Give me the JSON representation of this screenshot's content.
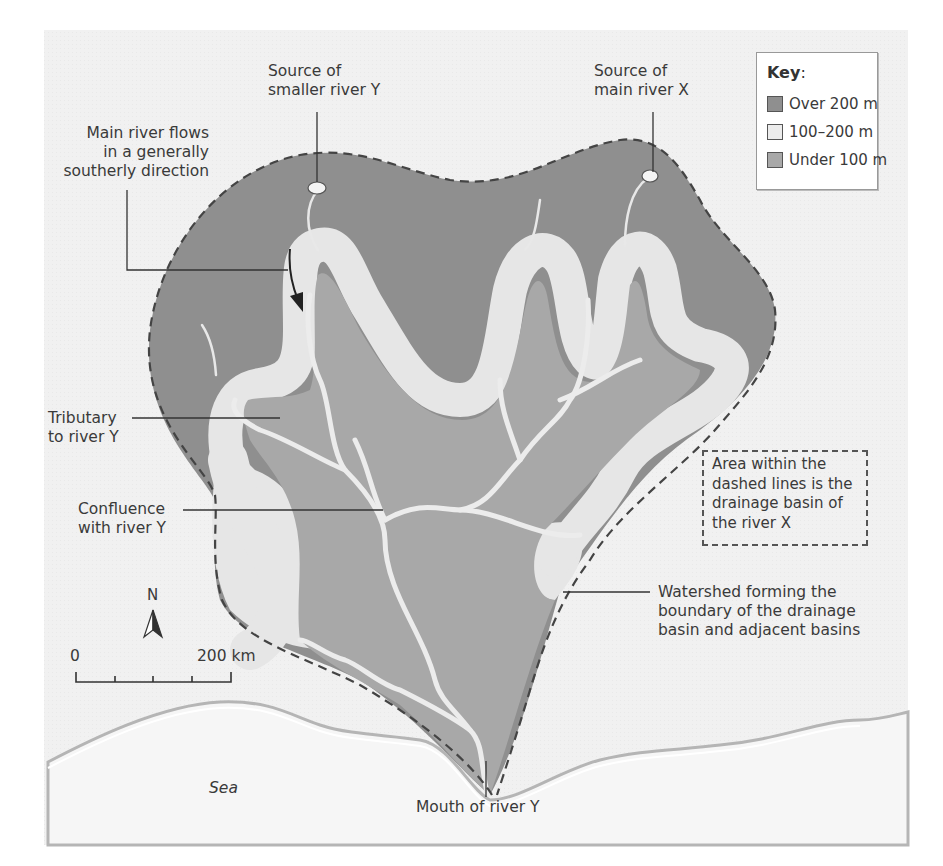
{
  "colors": {
    "background": "#f1f1f1",
    "over_200": "#8f8f8f",
    "between_100_200": "#e6e6e6",
    "under_100": "#a8a8a8",
    "sea": "#f4f4f4",
    "river": "#ececec",
    "line": "#333333"
  },
  "key": {
    "title": "Key",
    "colon": ":",
    "items": [
      {
        "label": "Over 200 m",
        "color": "#8f8f8f"
      },
      {
        "label": "100–200 m",
        "color": "#ececec"
      },
      {
        "label": "Under 100 m",
        "color": "#a8a8a8"
      }
    ]
  },
  "labels": {
    "source_y": [
      "Source of",
      "smaller river Y"
    ],
    "source_x": [
      "Source of",
      "main river X"
    ],
    "main_flow": [
      "Main river flows",
      "in a generally",
      "southerly direction"
    ],
    "tributary": [
      "Tributary",
      "to river Y"
    ],
    "confluence": [
      "Confluence",
      "with river Y"
    ],
    "watershed": [
      "Watershed forming the",
      "boundary of the drainage",
      "basin and adjacent basins"
    ],
    "mouth": "Mouth of river Y",
    "sea": "Sea"
  },
  "note": "Area within the dashed lines is the drainage basin of the river X",
  "compass": {
    "north": "N"
  },
  "scale_bar": {
    "start": "0",
    "end": "200 km"
  }
}
